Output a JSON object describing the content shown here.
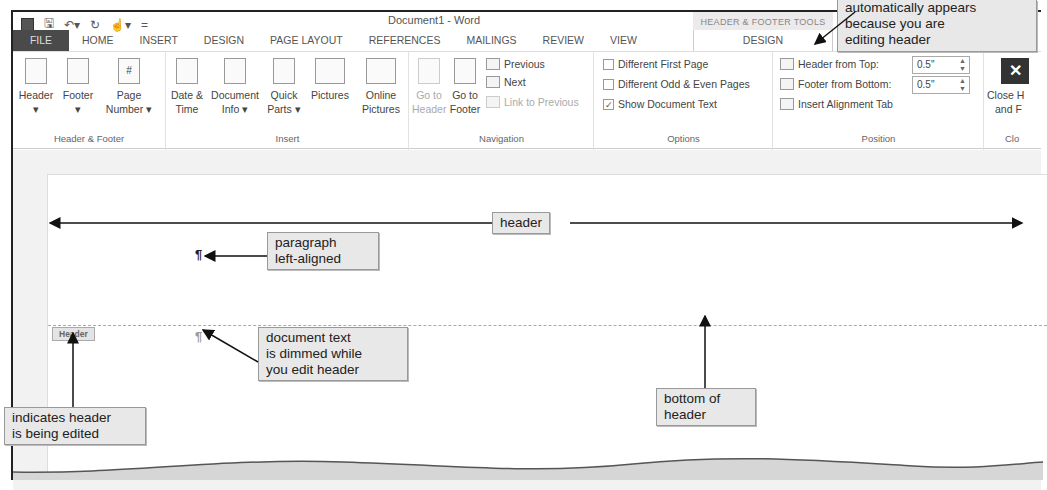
{
  "window": {
    "title": "Document1 - Word",
    "contextual_group": "HEADER & FOOTER TOOLS"
  },
  "quick_access": {
    "items": [
      "word-icon",
      "save-icon",
      "undo-icon",
      "redo-icon",
      "touch-mode-icon",
      "customize-icon"
    ]
  },
  "tabs": [
    {
      "label": "FILE"
    },
    {
      "label": "HOME"
    },
    {
      "label": "INSERT"
    },
    {
      "label": "DESIGN"
    },
    {
      "label": "PAGE LAYOUT"
    },
    {
      "label": "REFERENCES"
    },
    {
      "label": "MAILINGS"
    },
    {
      "label": "REVIEW"
    },
    {
      "label": "VIEW"
    },
    {
      "label": "DESIGN",
      "contextual": true,
      "active": true
    }
  ],
  "ribbon": {
    "groups": {
      "header_footer": {
        "label": "Header & Footer",
        "buttons": [
          {
            "line1": "Header",
            "line2": "▾"
          },
          {
            "line1": "Footer",
            "line2": "▾"
          },
          {
            "line1": "Page",
            "line2": "Number ▾"
          }
        ]
      },
      "insert": {
        "label": "Insert",
        "buttons": [
          {
            "line1": "Date &",
            "line2": "Time"
          },
          {
            "line1": "Document",
            "line2": "Info ▾"
          },
          {
            "line1": "Quick",
            "line2": "Parts ▾"
          },
          {
            "line1": "Pictures",
            "line2": ""
          },
          {
            "line1": "Online",
            "line2": "Pictures"
          }
        ]
      },
      "navigation": {
        "label": "Navigation",
        "buttons": [
          {
            "line1": "Go to",
            "line2": "Header",
            "disabled": true
          },
          {
            "line1": "Go to",
            "line2": "Footer",
            "disabled": false
          }
        ],
        "small": [
          {
            "label": "Previous",
            "disabled": false
          },
          {
            "label": "Next",
            "disabled": false
          },
          {
            "label": "Link to Previous",
            "disabled": true
          }
        ]
      },
      "options": {
        "label": "Options",
        "checkboxes": [
          {
            "label": "Different First Page",
            "checked": false
          },
          {
            "label": "Different Odd & Even Pages",
            "checked": false
          },
          {
            "label": "Show Document Text",
            "checked": true
          }
        ]
      },
      "position": {
        "label": "Position",
        "header_from_top": {
          "label": "Header from Top:",
          "value": "0.5\""
        },
        "footer_from_bottom": {
          "label": "Footer from Bottom:",
          "value": "0.5\""
        },
        "insert_alignment_tab": "Insert Alignment Tab"
      },
      "close": {
        "label": "Clo",
        "button_line1": "Close H",
        "button_line2": "and F",
        "icon_glyph": "✕"
      }
    }
  },
  "document": {
    "header_tab_label": "Header",
    "pilcrow": "¶"
  },
  "callouts": {
    "contextual_tab": [
      "automatically appears",
      "because you are",
      "editing header"
    ],
    "header": "header",
    "paragraph": [
      "paragraph",
      "left-aligned"
    ],
    "dimmed": [
      "document text",
      "is dimmed while",
      "you edit header"
    ],
    "indicates": [
      "indicates header",
      "is being edited"
    ],
    "bottom": [
      "bottom of",
      "header"
    ]
  },
  "colors": {
    "file_tab_bg": "#4a4a4a",
    "callout_bg": "#e8e8e8",
    "contextual_group_bg": "#eceaea"
  }
}
